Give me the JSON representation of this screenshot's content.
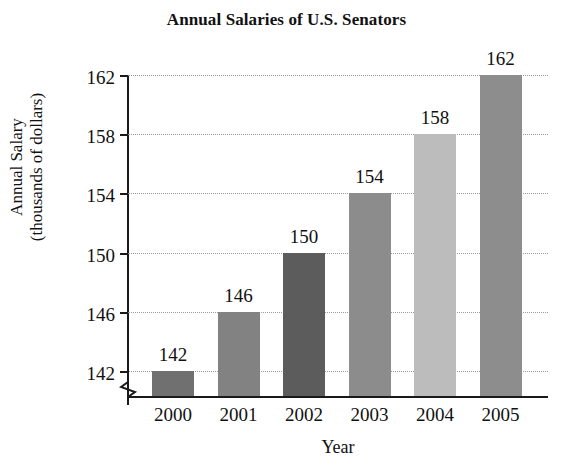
{
  "chart_data": {
    "type": "bar",
    "title": "Annual Salaries of U.S. Senators",
    "xlabel": "Year",
    "ylabel": "Annual Salary (thousands of dollars)",
    "ylabel_lines": [
      "Annual Salary",
      "(thousands of dollars)"
    ],
    "categories": [
      "2000",
      "2001",
      "2002",
      "2003",
      "2004",
      "2005"
    ],
    "values": [
      142,
      146,
      150,
      154,
      158,
      162
    ],
    "value_labels": [
      "142",
      "146",
      "150",
      "154",
      "158",
      "162"
    ],
    "yticks": [
      142,
      146,
      150,
      154,
      158,
      162
    ],
    "ytick_labels": [
      "142",
      "146",
      "150",
      "154",
      "158",
      "162"
    ],
    "ylim": [
      140,
      162
    ],
    "axis_break": true,
    "grid": true,
    "grid_axis": "y",
    "grid_style": "dotted",
    "legend": false,
    "bar_colors": [
      "#707070",
      "#828282",
      "#5c5c5c",
      "#8c8c8c",
      "#bcbcbc",
      "#8d8d8d"
    ],
    "axis_color": "#1a1a1a",
    "gridline_color": "#9a9a9a",
    "background": "#ffffff"
  }
}
